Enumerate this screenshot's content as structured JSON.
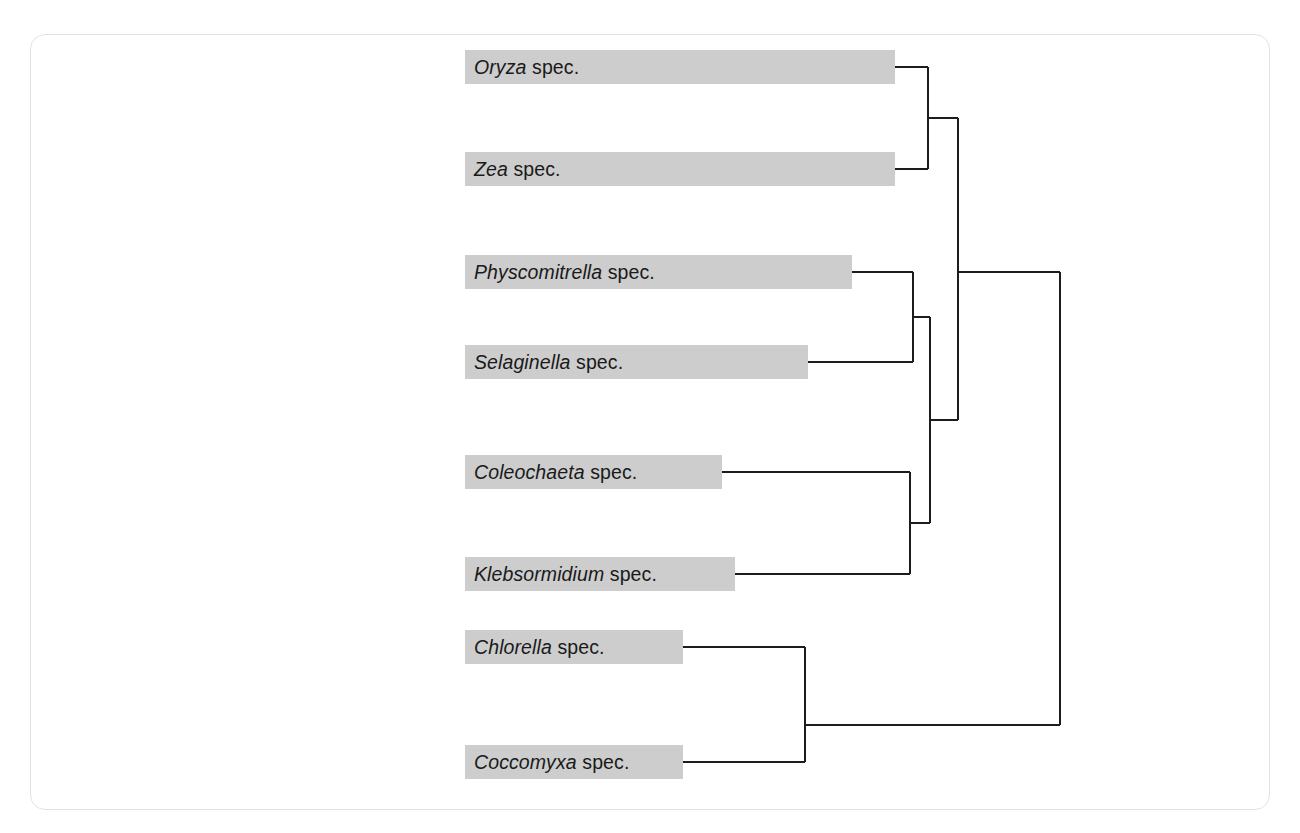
{
  "figure": {
    "kind": "cladogram",
    "panel_border_color": "#e2e2e2",
    "bar_color": "#cdcdcd",
    "branch_color": "#1c1c1c",
    "background_color": "#ffffff"
  },
  "taxa": [
    {
      "genus": "Oryza",
      "epithet": "spec.",
      "bar": {
        "x": 465,
        "y": 50,
        "width": 430,
        "height": 34
      },
      "tip_x": 895
    },
    {
      "genus": "Zea",
      "epithet": "spec.",
      "bar": {
        "x": 465,
        "y": 152,
        "width": 430,
        "height": 34
      },
      "tip_x": 895
    },
    {
      "genus": "Physcomitrella",
      "epithet": "spec.",
      "bar": {
        "x": 465,
        "y": 255,
        "width": 387,
        "height": 34
      },
      "tip_x": 852
    },
    {
      "genus": "Selaginella",
      "epithet": "spec.",
      "bar": {
        "x": 465,
        "y": 345,
        "width": 343,
        "height": 34
      },
      "tip_x": 808
    },
    {
      "genus": "Coleochaeta",
      "epithet": "spec.",
      "bar": {
        "x": 465,
        "y": 455,
        "width": 257,
        "height": 34
      },
      "tip_x": 722
    },
    {
      "genus": "Klebsormidium",
      "epithet": "spec.",
      "bar": {
        "x": 465,
        "y": 557,
        "width": 270,
        "height": 34
      },
      "tip_x": 735
    },
    {
      "genus": "Chlorella",
      "epithet": "spec.",
      "bar": {
        "x": 465,
        "y": 630,
        "width": 218,
        "height": 34
      },
      "tip_x": 683
    },
    {
      "genus": "Coccomyxa",
      "epithet": "spec.",
      "bar": {
        "x": 465,
        "y": 745,
        "width": 218,
        "height": 34
      },
      "tip_x": 683
    }
  ],
  "chart_data": {
    "type": "diagram",
    "title": "",
    "leaves": [
      "Oryza spec.",
      "Zea spec.",
      "Physcomitrella spec.",
      "Selaginella spec.",
      "Coleochaeta spec.",
      "Klebsormidium spec.",
      "Chlorella spec.",
      "Coccomyxa spec."
    ],
    "newick": "(((Oryza,Zea),((Physcomitrella,Selaginella),(Coleochaeta,Klebsormidium))),(Chlorella,Coccomyxa));",
    "nodes": [
      {
        "name": "angiosperms",
        "x": 928,
        "children": [
          "Oryza spec.",
          "Zea spec."
        ],
        "y_top": 67,
        "y_bottom": 169,
        "y_mid": 118
      },
      {
        "name": "land-plants-moss-lycophyte",
        "x": 913,
        "children": [
          "Physcomitrella spec.",
          "Selaginella spec."
        ],
        "y_top": 272,
        "y_bottom": 362,
        "y_mid": 317
      },
      {
        "name": "charophyte-algae",
        "x": 910,
        "children": [
          "Coleochaeta spec.",
          "Klebsormidium spec."
        ],
        "y_top": 472,
        "y_bottom": 574,
        "y_mid": 523
      },
      {
        "name": "streptophyte-lower",
        "x": 930,
        "children": [
          "land-plants-moss-lycophyte",
          "charophyte-algae"
        ],
        "y_top": 317,
        "y_bottom": 523,
        "y_mid": 420
      },
      {
        "name": "streptophyta",
        "x": 958,
        "children": [
          "angiosperms",
          "streptophyte-lower"
        ],
        "y_top": 118,
        "y_bottom": 420,
        "y_mid": 272
      },
      {
        "name": "chlorophyte-algae",
        "x": 805,
        "children": [
          "Chlorella spec.",
          "Coccomyxa spec."
        ],
        "y_top": 647,
        "y_bottom": 762,
        "y_mid": 725
      },
      {
        "name": "root",
        "x": 1060,
        "children": [
          "streptophyta",
          "chlorophyte-algae"
        ],
        "y_top": 272,
        "y_bottom": 725,
        "y_mid": 498
      }
    ]
  }
}
